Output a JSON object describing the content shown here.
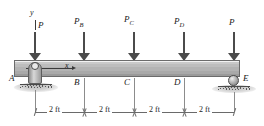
{
  "figure": {
    "axes": {
      "y_label": "y",
      "x_label": "x"
    },
    "loads": [
      {
        "label": "P",
        "sub": "",
        "point": "A",
        "x_ft": 0
      },
      {
        "label": "P",
        "sub": "B",
        "point": "B",
        "x_ft": 2
      },
      {
        "label": "P",
        "sub": "C",
        "point": "C",
        "x_ft": 4
      },
      {
        "label": "P",
        "sub": "D",
        "point": "D",
        "x_ft": 6
      },
      {
        "label": "P",
        "sub": "",
        "point": "E",
        "x_ft": 8
      }
    ],
    "points": [
      {
        "name": "A",
        "support": "pin"
      },
      {
        "name": "B",
        "support": "none"
      },
      {
        "name": "C",
        "support": "none"
      },
      {
        "name": "D",
        "support": "none"
      },
      {
        "name": "E",
        "support": "roller"
      }
    ],
    "dimensions": [
      {
        "label": "2 ft"
      },
      {
        "label": "2 ft"
      },
      {
        "label": "2 ft"
      },
      {
        "label": "2 ft"
      }
    ],
    "colors": {
      "beam": "#b3b3b3",
      "arrow": "#4b4b4b",
      "outline": "#5e5e5e",
      "text": "#1a1a1a",
      "dimension": "#6a6a6a"
    }
  }
}
